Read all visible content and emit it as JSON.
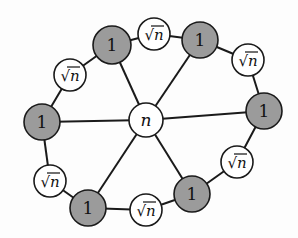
{
  "diagram": {
    "type": "wheel-graph",
    "colors": {
      "gray_node": "#9b9b9b",
      "white_node": "#ffffff",
      "edge": "#1a1a1a",
      "background": "#fdfdfd"
    },
    "center": {
      "id": "c",
      "label": "n",
      "x": 146,
      "y": 120,
      "r": 17
    },
    "rim_nodes": [
      {
        "id": "g1",
        "kind": "gray",
        "label": "1",
        "x": 112,
        "y": 45,
        "r": 19
      },
      {
        "id": "s1",
        "kind": "white",
        "label": "√n",
        "x": 154,
        "y": 34,
        "r": 16
      },
      {
        "id": "g2",
        "kind": "gray",
        "label": "1",
        "x": 200,
        "y": 40,
        "r": 18
      },
      {
        "id": "s2",
        "kind": "white",
        "label": "√n",
        "x": 248,
        "y": 60,
        "r": 16
      },
      {
        "id": "g3",
        "kind": "gray",
        "label": "1",
        "x": 264,
        "y": 111,
        "r": 18
      },
      {
        "id": "s3",
        "kind": "white",
        "label": "√n",
        "x": 237,
        "y": 162,
        "r": 16
      },
      {
        "id": "g4",
        "kind": "gray",
        "label": "1",
        "x": 192,
        "y": 194,
        "r": 18
      },
      {
        "id": "s4",
        "kind": "white",
        "label": "√n",
        "x": 146,
        "y": 210,
        "r": 16
      },
      {
        "id": "g5",
        "kind": "gray",
        "label": "1",
        "x": 88,
        "y": 208,
        "r": 18
      },
      {
        "id": "s5",
        "kind": "white",
        "label": "√n",
        "x": 50,
        "y": 181,
        "r": 16
      },
      {
        "id": "g6",
        "kind": "gray",
        "label": "1",
        "x": 42,
        "y": 122,
        "r": 18
      },
      {
        "id": "s6",
        "kind": "white",
        "label": "√n",
        "x": 70,
        "y": 75,
        "r": 16
      }
    ],
    "spokes": [
      "g1",
      "g2",
      "g3",
      "g4",
      "g5",
      "g6"
    ]
  }
}
